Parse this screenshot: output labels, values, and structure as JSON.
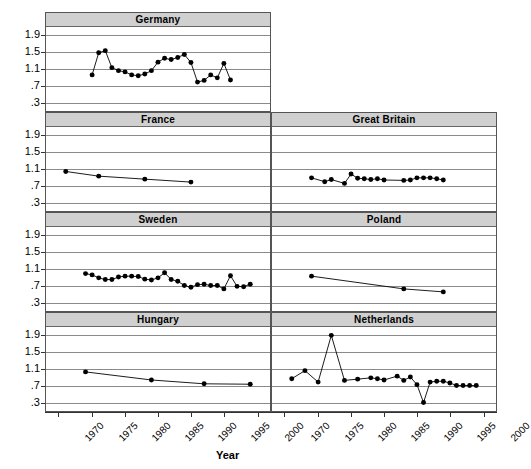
{
  "chart_data": {
    "type": "line",
    "title": "",
    "xlabel": "Year",
    "ylabel": "",
    "xlim": [
      1968,
      2002
    ],
    "ylim": [
      0.1,
      2.1
    ],
    "xticks": [
      1970,
      1975,
      1980,
      1985,
      1990,
      1995,
      2000
    ],
    "xticklabels": [
      "1970",
      "1975",
      "1980",
      "1985",
      "1990",
      "1995",
      "2000"
    ],
    "yticks": [
      0.3,
      0.7,
      1.1,
      1.5,
      1.9
    ],
    "yticklabels": [
      ".3",
      ".7",
      "1.1",
      "1.5",
      "1.9"
    ],
    "grid": true,
    "legend": "none",
    "marker": "filled-circle",
    "panel_layout": "trellis 4 rows x 2 columns, first row single wide panel",
    "panels": [
      {
        "name": "Germany",
        "row": 1,
        "col": 1,
        "series": [
          {
            "name": "Germany",
            "x": [
              1975,
              1976,
              1977,
              1978,
              1979,
              1980,
              1981,
              1982,
              1983,
              1984,
              1985,
              1986,
              1987,
              1988,
              1989,
              1990,
              1991,
              1992,
              1993,
              1994,
              1995,
              1996
            ],
            "y": [
              0.95,
              1.47,
              1.52,
              1.12,
              1.05,
              1.02,
              0.95,
              0.93,
              0.97,
              1.05,
              1.25,
              1.34,
              1.31,
              1.36,
              1.43,
              1.24,
              0.78,
              0.82,
              0.95,
              0.88,
              1.22,
              0.83
            ]
          }
        ]
      },
      {
        "name": "France",
        "row": 2,
        "col": 1,
        "series": [
          {
            "name": "France",
            "x": [
              1971,
              1976,
              1983,
              1990
            ],
            "y": [
              1.03,
              0.92,
              0.85,
              0.78
            ]
          }
        ]
      },
      {
        "name": "Great Britain",
        "row": 2,
        "col": 2,
        "series": [
          {
            "name": "Great Britain",
            "x": [
              1974,
              1976,
              1977,
              1979,
              1980,
              1981,
              1982,
              1983,
              1984,
              1985,
              1988,
              1989,
              1990,
              1991,
              1992,
              1993,
              1994
            ],
            "y": [
              0.88,
              0.79,
              0.84,
              0.75,
              0.97,
              0.87,
              0.86,
              0.84,
              0.86,
              0.83,
              0.82,
              0.83,
              0.88,
              0.88,
              0.88,
              0.86,
              0.83
            ]
          }
        ]
      },
      {
        "name": "Sweden",
        "row": 3,
        "col": 1,
        "series": [
          {
            "name": "Sweden",
            "x": [
              1974,
              1975,
              1976,
              1977,
              1978,
              1979,
              1980,
              1981,
              1982,
              1983,
              1984,
              1985,
              1986,
              1987,
              1988,
              1989,
              1990,
              1991,
              1992,
              1993,
              1994,
              1995,
              1996,
              1997,
              1998,
              1999
            ],
            "y": [
              0.98,
              0.95,
              0.88,
              0.84,
              0.84,
              0.9,
              0.92,
              0.92,
              0.91,
              0.85,
              0.83,
              0.88,
              1.0,
              0.84,
              0.8,
              0.7,
              0.66,
              0.72,
              0.73,
              0.7,
              0.7,
              0.62,
              0.93,
              0.68,
              0.67,
              0.73
            ]
          }
        ]
      },
      {
        "name": "Poland",
        "row": 3,
        "col": 2,
        "series": [
          {
            "name": "Poland",
            "x": [
              1974,
              1988,
              1994
            ],
            "y": [
              0.92,
              0.62,
              0.55
            ]
          }
        ]
      },
      {
        "name": "Hungary",
        "row": 4,
        "col": 1,
        "series": [
          {
            "name": "Hungary",
            "x": [
              1974,
              1984,
              1992,
              1999
            ],
            "y": [
              1.02,
              0.83,
              0.74,
              0.73
            ]
          }
        ]
      },
      {
        "name": "Netherlands",
        "row": 4,
        "col": 2,
        "series": [
          {
            "name": "Netherlands",
            "x": [
              1971,
              1973,
              1975,
              1977,
              1979,
              1981,
              1983,
              1984,
              1985,
              1987,
              1988,
              1989,
              1990,
              1991,
              1992,
              1993,
              1994,
              1995,
              1996,
              1997,
              1998,
              1999
            ],
            "y": [
              0.86,
              1.05,
              0.78,
              1.88,
              0.82,
              0.85,
              0.88,
              0.86,
              0.83,
              0.92,
              0.82,
              0.9,
              0.72,
              0.3,
              0.78,
              0.8,
              0.8,
              0.76,
              0.7,
              0.7,
              0.7,
              0.7
            ]
          }
        ]
      }
    ]
  }
}
